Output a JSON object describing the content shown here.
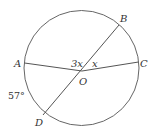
{
  "diagram": {
    "type": "circle-geometry",
    "points": {
      "A": {
        "label": "A"
      },
      "B": {
        "label": "B"
      },
      "C": {
        "label": "C"
      },
      "D": {
        "label": "D"
      },
      "O": {
        "label": "O"
      }
    },
    "angles": {
      "AOB": "3x",
      "BOC": "x",
      "arc_AD": "57°"
    },
    "colors": {
      "stroke": "#555555",
      "text": "#333333"
    }
  }
}
